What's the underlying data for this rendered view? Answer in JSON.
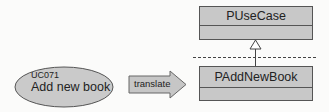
{
  "diagram": {
    "use_case": {
      "id": "UC071",
      "name": "Add new book"
    },
    "transform_arrow": {
      "label": "translate"
    },
    "classes": [
      {
        "name": "PUseCase"
      },
      {
        "name": "PAddNewBook"
      }
    ],
    "relationships": [
      {
        "type": "generalization",
        "from": "PAddNewBook",
        "to": "PUseCase"
      }
    ],
    "colors": {
      "shape_fill": "#c8c8c8",
      "stroke": "#555555",
      "background": "#fbfbfa"
    }
  }
}
